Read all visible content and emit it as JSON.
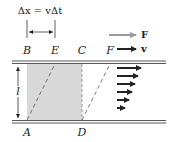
{
  "formula": {
    "text": "Δx = vΔt"
  },
  "legend": {
    "force": {
      "label": "F",
      "color": "#9a9a9a"
    },
    "velocity": {
      "label": "v",
      "color": "#222222"
    }
  },
  "points": {
    "A": "A",
    "B": "B",
    "C": "C",
    "D": "D",
    "E": "E",
    "F": "F"
  },
  "thickness_label": "l",
  "colors": {
    "shade": "#d9d9d9",
    "line": "#444444"
  },
  "velocity_profile": {
    "arrow_count": 6,
    "description": "Velocity arrows decreasing in length from top plate to bottom plate"
  }
}
